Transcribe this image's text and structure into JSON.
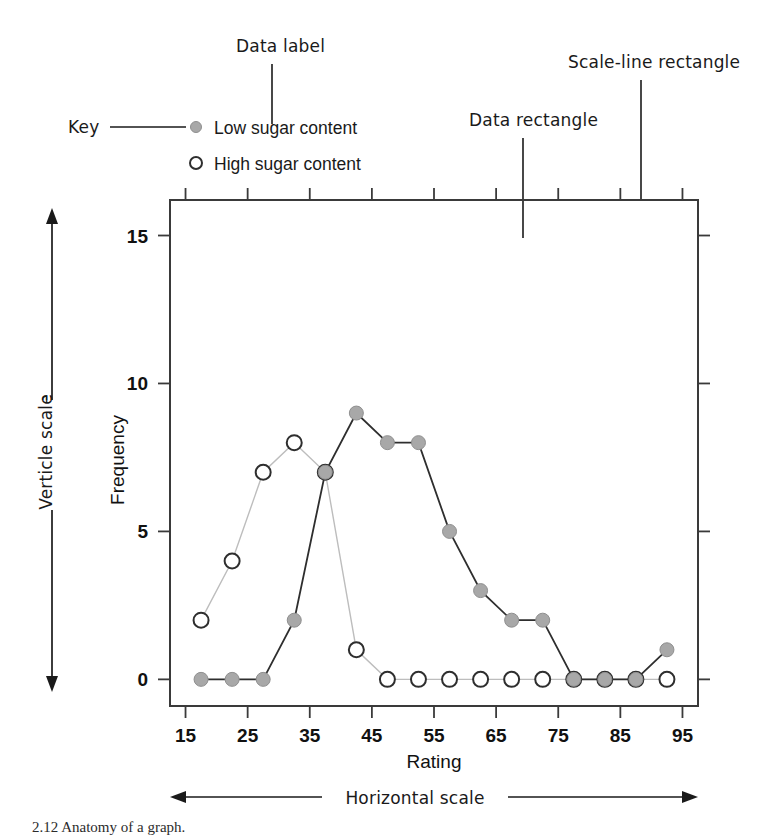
{
  "chart_data": {
    "type": "line",
    "title": "",
    "xlabel": "Rating",
    "ylabel": "Frequency",
    "xlim": [
      12.5,
      97.5
    ],
    "ylim": [
      -0.9,
      16.2
    ],
    "xticks": [
      15,
      25,
      35,
      45,
      55,
      65,
      75,
      85,
      95
    ],
    "xticklabels": [
      "15",
      "25",
      "35",
      "45",
      "55",
      "65",
      "75",
      "85",
      "95"
    ],
    "yticks": [
      0,
      5,
      10,
      15
    ],
    "yticklabels": [
      "0",
      "5",
      "10",
      "15"
    ],
    "grid": false,
    "legend_position": "above-left",
    "x": [
      17.5,
      22.5,
      27.5,
      32.5,
      37.5,
      42.5,
      47.5,
      52.5,
      57.5,
      62.5,
      67.5,
      72.5,
      77.5,
      82.5,
      87.5,
      92.5
    ],
    "series": [
      {
        "name": "Low sugar content",
        "marker": "filled-circle",
        "color": "#a8a8a8",
        "line_color": "#2e2e2e",
        "values": [
          0,
          0,
          0,
          2,
          7,
          9,
          8,
          8,
          5,
          3,
          2,
          2,
          0,
          0,
          0,
          1
        ]
      },
      {
        "name": "High sugar content",
        "marker": "open-circle",
        "color": "#ffffff",
        "line_color": "#bdbdbd",
        "values": [
          2,
          4,
          7,
          8,
          7,
          1,
          0,
          0,
          0,
          0,
          0,
          0,
          0,
          0,
          0,
          0
        ]
      }
    ]
  },
  "legend": {
    "items": [
      {
        "label": "Low sugar content",
        "marker": "filled-circle"
      },
      {
        "label": "High sugar content",
        "marker": "open-circle"
      }
    ]
  },
  "annotations": {
    "key": "Key",
    "data_label": "Data label",
    "data_rectangle": "Data rectangle",
    "scale_line_rectangle": "Scale-line rectangle",
    "vertical_scale": "Verticle scale",
    "horizontal_scale": "Horizontal scale"
  },
  "caption": {
    "text": "2.12   Anatomy of a graph."
  }
}
